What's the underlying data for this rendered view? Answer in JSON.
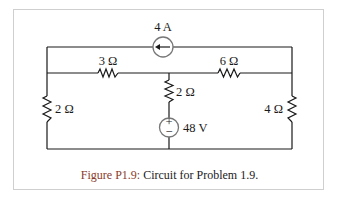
{
  "figure": {
    "caption_label": "Figure P1.9:",
    "caption_text": " Circuit for Problem 1.9."
  },
  "components": {
    "current_source": {
      "label": "4 A",
      "direction": "left"
    },
    "r_top_left": {
      "label": "3 Ω"
    },
    "r_top_right": {
      "label": "6 Ω"
    },
    "r_middle": {
      "label": "2 Ω"
    },
    "r_left": {
      "label": "2 Ω"
    },
    "r_right": {
      "label": "4 Ω"
    },
    "voltage_source": {
      "label": "48 V",
      "plus": "+",
      "minus": "−"
    }
  },
  "colors": {
    "wire": "#1a1a1a",
    "frame": "#cfcfcf",
    "source_outline": "#777777",
    "caption_label": "#8a3a2a"
  }
}
